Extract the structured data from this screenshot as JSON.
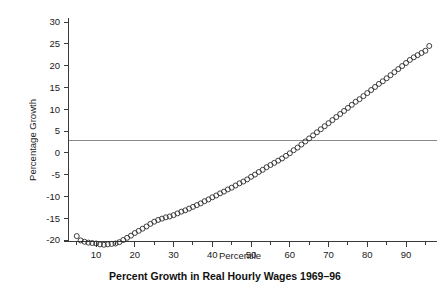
{
  "chart_data": {
    "type": "scatter",
    "title": "Percent Growth in Real Hourly Wages 1969–96",
    "xlabel": "Percentile",
    "ylabel": "Percentage Growth",
    "xlim": [
      3,
      98
    ],
    "ylim": [
      -23,
      32
    ],
    "grid": false,
    "legend": null,
    "marker": "open-circle",
    "reference_lines": [
      {
        "axis": "y",
        "value": 0,
        "color": "#8a8a8a"
      }
    ],
    "xticks": [
      10,
      20,
      30,
      40,
      50,
      60,
      70,
      80,
      90
    ],
    "xtick_labels": [
      "10",
      "20",
      "30",
      "40",
      "50",
      "60",
      "70",
      "80",
      "90"
    ],
    "xminor_ticks": [
      5,
      15,
      25,
      35,
      45,
      55,
      65,
      75,
      85,
      95
    ],
    "yticks": [
      -20,
      -15,
      -10,
      -5,
      0,
      5,
      10,
      15,
      20,
      25,
      30
    ],
    "ytick_labels": [
      "-20",
      "-15",
      "-10",
      "-5",
      "0",
      "5",
      "10",
      "15",
      "20",
      "25",
      "30"
    ],
    "x": [
      5,
      6,
      7,
      8,
      9,
      10,
      11,
      12,
      13,
      14,
      15,
      16,
      17,
      18,
      19,
      20,
      21,
      22,
      23,
      24,
      25,
      26,
      27,
      28,
      29,
      30,
      31,
      32,
      33,
      34,
      35,
      36,
      37,
      38,
      39,
      40,
      41,
      42,
      43,
      44,
      45,
      46,
      47,
      48,
      49,
      50,
      51,
      52,
      53,
      54,
      55,
      56,
      57,
      58,
      59,
      60,
      61,
      62,
      63,
      64,
      65,
      66,
      67,
      68,
      69,
      70,
      71,
      72,
      73,
      74,
      75,
      76,
      77,
      78,
      79,
      80,
      81,
      82,
      83,
      84,
      85,
      86,
      87,
      88,
      89,
      90,
      91,
      92,
      93,
      94,
      95,
      96
    ],
    "y": [
      -19.1,
      -20.1,
      -20.4,
      -20.6,
      -20.7,
      -20.8,
      -21.0,
      -21.1,
      -21.0,
      -20.9,
      -20.8,
      -20.5,
      -20.0,
      -19.5,
      -19.0,
      -18.4,
      -17.9,
      -17.4,
      -16.9,
      -16.3,
      -15.8,
      -15.4,
      -15.1,
      -14.8,
      -14.6,
      -14.3,
      -13.9,
      -13.5,
      -13.2,
      -12.8,
      -12.4,
      -12.0,
      -11.6,
      -11.1,
      -10.7,
      -10.2,
      -9.8,
      -9.3,
      -8.9,
      -8.4,
      -8.0,
      -7.5,
      -7.0,
      -6.6,
      -6.1,
      -5.5,
      -5.0,
      -4.4,
      -3.9,
      -3.3,
      -2.8,
      -2.3,
      -1.8,
      -1.3,
      -0.7,
      -0.1,
      0.6,
      1.2,
      1.9,
      2.6,
      3.3,
      4.0,
      4.7,
      5.4,
      6.1,
      6.8,
      7.5,
      8.2,
      8.9,
      9.6,
      10.3,
      11.0,
      11.7,
      12.3,
      13.0,
      13.7,
      14.4,
      15.1,
      15.8,
      16.4,
      17.1,
      17.8,
      18.5,
      19.2,
      19.9,
      20.6,
      21.3,
      21.9,
      22.4,
      22.9,
      23.4,
      24.5
    ]
  }
}
